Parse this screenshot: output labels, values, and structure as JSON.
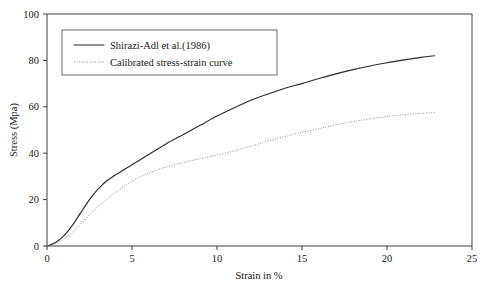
{
  "chart_data": {
    "type": "line",
    "title": "",
    "xlabel": "Strain in %",
    "ylabel": "Stress (Mpa)",
    "xlim": [
      0,
      25
    ],
    "ylim": [
      0,
      100
    ],
    "xticks": [
      0,
      5,
      10,
      15,
      20,
      25
    ],
    "yticks": [
      0,
      20,
      40,
      60,
      80,
      100
    ],
    "xtick_labels": [
      "0",
      "5",
      "10",
      "15",
      "20",
      "25"
    ],
    "ytick_labels": [
      "0",
      "20",
      "40",
      "60",
      "80",
      "100"
    ],
    "grid": false,
    "legend_position": "upper-left-inside",
    "series": [
      {
        "name": "Shirazi-Adl et al.(1986)",
        "style": "solid",
        "color": "#2b2b2b",
        "x": [
          0,
          0.5,
          1.0,
          1.5,
          2.0,
          2.5,
          3.0,
          3.5,
          4.0,
          4.5,
          5.0,
          6.0,
          7.0,
          8.0,
          9.0,
          10.0,
          11.0,
          12.0,
          13.0,
          14.0,
          15.0,
          16.0,
          17.0,
          18.0,
          19.0,
          20.0,
          21.0,
          22.0,
          22.8
        ],
        "y": [
          0,
          1.5,
          4.5,
          9.0,
          14.5,
          20.0,
          24.5,
          28.0,
          30.5,
          32.8,
          35.0,
          39.5,
          44.0,
          48.0,
          52.0,
          56.0,
          59.5,
          62.8,
          65.5,
          68.0,
          70.0,
          72.2,
          74.2,
          76.0,
          77.6,
          79.0,
          80.2,
          81.3,
          82.0
        ]
      },
      {
        "name": "Calibrated stress-strain curve",
        "style": "dotted",
        "color": "#8c8c8c",
        "x": [
          0,
          0.5,
          1.0,
          1.5,
          2.0,
          2.5,
          3.0,
          3.5,
          4.0,
          4.5,
          5.0,
          6.0,
          7.0,
          8.0,
          9.0,
          10.0,
          11.0,
          12.0,
          13.0,
          14.0,
          15.0,
          16.0,
          17.0,
          18.0,
          19.0,
          20.0,
          21.0,
          22.0,
          22.8
        ],
        "y": [
          0,
          1.0,
          3.0,
          6.0,
          9.5,
          13.5,
          17.0,
          20.0,
          23.0,
          25.5,
          28.0,
          31.5,
          34.0,
          36.0,
          37.6,
          39.2,
          41.0,
          43.0,
          45.2,
          47.2,
          49.0,
          50.6,
          52.2,
          53.6,
          54.8,
          55.8,
          56.6,
          57.2,
          57.5
        ]
      }
    ],
    "legend_entries": [
      {
        "label": "Shirazi-Adl et al.(1986)",
        "style": "solid",
        "color": "#2b2b2b"
      },
      {
        "label": "Calibrated stress-strain curve",
        "style": "dotted",
        "color": "#8c8c8c"
      }
    ]
  },
  "colors": {
    "background": "#ffffff",
    "axis": "#3c3c3c",
    "text": "#1a1a1a",
    "legend_border": "#6b6b6b",
    "series_solid": "#2b2b2b",
    "series_dotted": "#8c8c8c"
  }
}
